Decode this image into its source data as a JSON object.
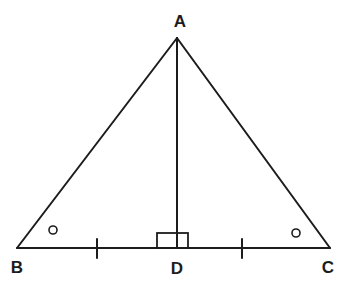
{
  "diagram": {
    "type": "geometry-figure",
    "background_color": "#ffffff",
    "line_color": "#1c1c1c",
    "stroke_width": 2,
    "points": {
      "A": {
        "label": "A",
        "x": 177,
        "y": 38,
        "label_x": 180,
        "label_y": 21
      },
      "B": {
        "label": "B",
        "x": 17,
        "y": 248,
        "label_x": 17,
        "label_y": 267
      },
      "C": {
        "label": "C",
        "x": 330,
        "y": 248,
        "label_x": 328,
        "label_y": 267
      },
      "D": {
        "label": "D",
        "x": 177,
        "y": 248,
        "label_x": 177,
        "label_y": 268
      }
    },
    "segments": [
      {
        "name": "AB",
        "from": "A",
        "to": "B"
      },
      {
        "name": "AC",
        "from": "A",
        "to": "C"
      },
      {
        "name": "BC",
        "from": "B",
        "to": "C"
      },
      {
        "name": "AD",
        "from": "A",
        "to": "D"
      }
    ],
    "right_angle_mark": {
      "at": "D",
      "x": 157,
      "y": 233,
      "width": 31,
      "height": 15,
      "stroke_width": 1.8
    },
    "angle_marks": [
      {
        "at": "B",
        "cx": 53,
        "cy": 230,
        "r": 4,
        "stroke_width": 1.6
      },
      {
        "at": "C",
        "cx": 296,
        "cy": 233,
        "r": 4,
        "stroke_width": 1.6
      }
    ],
    "tick_marks": [
      {
        "on": "BD",
        "x": 97,
        "y1": 239,
        "y2": 258,
        "stroke_width": 2
      },
      {
        "on": "DC",
        "x": 242,
        "y1": 239,
        "y2": 258,
        "stroke_width": 2
      }
    ]
  }
}
